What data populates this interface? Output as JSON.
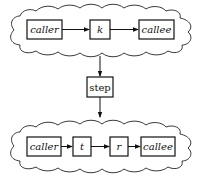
{
  "diagram": {
    "top_cloud": {
      "nodes": [
        {
          "id": "caller",
          "label": "caller",
          "italic": true
        },
        {
          "id": "k",
          "label": "k",
          "italic": true
        },
        {
          "id": "callee",
          "label": "callee",
          "italic": true
        }
      ],
      "edges": [
        [
          "caller",
          "k"
        ],
        [
          "k",
          "callee"
        ]
      ]
    },
    "transition": {
      "label": "step"
    },
    "bottom_cloud": {
      "nodes": [
        {
          "id": "caller",
          "label": "caller",
          "italic": true
        },
        {
          "id": "t",
          "label": "t",
          "italic": true
        },
        {
          "id": "r",
          "label": "r",
          "italic": true
        },
        {
          "id": "callee",
          "label": "callee",
          "italic": true
        }
      ],
      "edges": [
        [
          "caller",
          "t"
        ],
        [
          "t",
          "r"
        ],
        [
          "r",
          "callee"
        ]
      ]
    },
    "flow": [
      [
        "top_cloud",
        "step"
      ],
      [
        "step",
        "bottom_cloud"
      ]
    ]
  }
}
